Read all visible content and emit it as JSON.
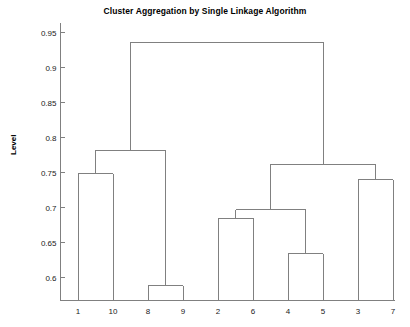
{
  "chart_data": {
    "type": "dendrogram",
    "title": "Cluster Aggregation by Single Linkage Algorithm",
    "xlabel": "",
    "ylabel": "Level",
    "leaf_order": [
      "1",
      "10",
      "8",
      "9",
      "2",
      "6",
      "4",
      "5",
      "3",
      "7"
    ],
    "y_ticks": [
      "0.95",
      "0.9",
      "0.85",
      "0.8",
      "0.75",
      "0.7",
      "0.65",
      "0.6"
    ],
    "y_tick_values": [
      0.95,
      0.9,
      0.85,
      0.8,
      0.75,
      0.7,
      0.65,
      0.6
    ],
    "ylim": [
      0.565,
      0.968
    ],
    "grid": false,
    "legend": false,
    "line_color": "#808080",
    "axis_color": "#808080",
    "merges": [
      {
        "id": "m1",
        "left": "8",
        "right": "9",
        "level": 0.588
      },
      {
        "id": "m2",
        "left": "4",
        "right": "5",
        "level": 0.634
      },
      {
        "id": "m3",
        "left": "2",
        "right": "6",
        "level": 0.685
      },
      {
        "id": "m4",
        "left": "m3",
        "right": "m2",
        "level": 0.697
      },
      {
        "id": "m5",
        "left": "3",
        "right": "7",
        "level": 0.74
      },
      {
        "id": "m6",
        "left": "1",
        "right": "10",
        "level": 0.748
      },
      {
        "id": "m7",
        "left": "m4",
        "right": "m5",
        "level": 0.762
      },
      {
        "id": "m8",
        "left": "m6",
        "right": "m1",
        "level": 0.782
      },
      {
        "id": "m9",
        "left": "m8",
        "right": "m7",
        "level": 0.936
      }
    ]
  }
}
